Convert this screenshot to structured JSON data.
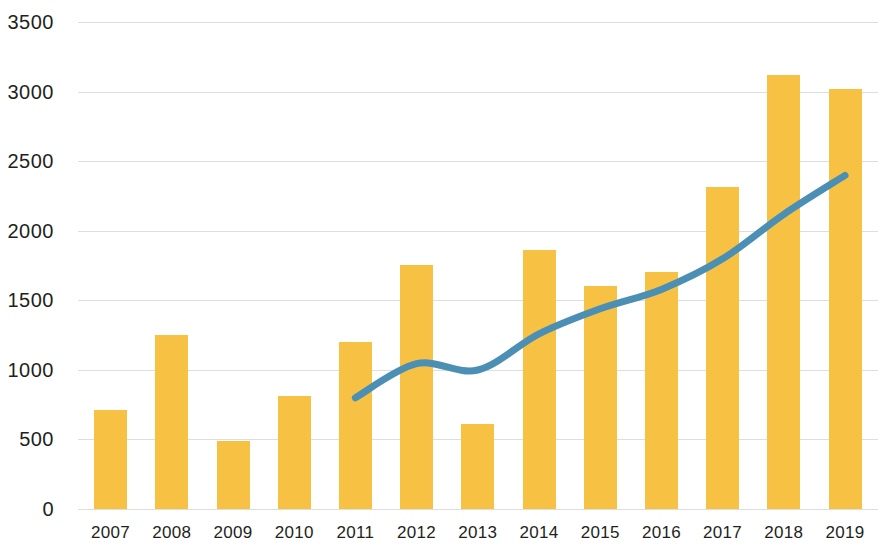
{
  "chart_data": {
    "type": "bar",
    "title": "",
    "subtitle": "",
    "xlabel": "",
    "ylabel": "",
    "categories": [
      "2007",
      "2008",
      "2009",
      "2010",
      "2011",
      "2012",
      "2013",
      "2014",
      "2015",
      "2016",
      "2017",
      "2018",
      "2019"
    ],
    "ylim": [
      0,
      3500
    ],
    "yticks": [
      0,
      500,
      1000,
      1500,
      2000,
      2500,
      3000,
      3500
    ],
    "ytick_labels": [
      "0",
      "500",
      "1000",
      "1500",
      "2000",
      "2500",
      "3000",
      "3500"
    ],
    "grid": true,
    "grid_axis": "y",
    "legend": false,
    "legend_position": "none",
    "series": [
      {
        "name": "bars",
        "type": "bar",
        "color": "#F7C243",
        "values": [
          710,
          1255,
          490,
          815,
          1205,
          1755,
          610,
          1860,
          1605,
          1705,
          2315,
          3120,
          3020
        ]
      },
      {
        "name": "line",
        "type": "line",
        "color": "#4B8FB5",
        "x": [
          "2011",
          "2012",
          "2013",
          "2014",
          "2015",
          "2016",
          "2017",
          "2018",
          "2019"
        ],
        "values": [
          800,
          1045,
          1000,
          1260,
          1440,
          1580,
          1800,
          2120,
          2400
        ]
      }
    ]
  },
  "colors": {
    "bar": "#F7C243",
    "line": "#4B8FB5",
    "grid": "#dedede",
    "text": "#231f20",
    "background": "#ffffff"
  }
}
